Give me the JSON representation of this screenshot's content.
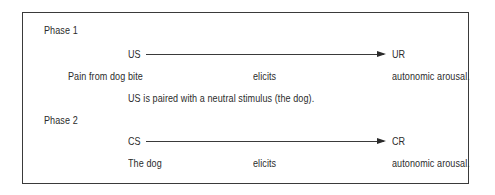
{
  "phase1": {
    "label": "Phase 1",
    "stimulus": "US",
    "response": "UR",
    "row": {
      "cause": "Pain from dog bite",
      "verb": "elicits",
      "effect": "autonomic arousal."
    },
    "note": "US is paired with a neutral stimulus (the dog)."
  },
  "phase2": {
    "label": "Phase 2",
    "stimulus": "CS",
    "response": "CR",
    "row": {
      "cause": "The dog",
      "verb": "elicits",
      "effect": "autonomic arousal."
    }
  }
}
